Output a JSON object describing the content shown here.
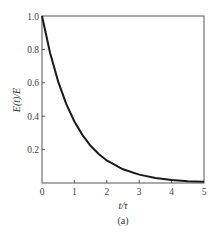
{
  "chart_data": {
    "type": "line",
    "title": "",
    "caption": "(a)",
    "xlabel": "t/τ",
    "ylabel": "E(t)/E",
    "xlim": [
      0,
      5
    ],
    "ylim": [
      0,
      1.0
    ],
    "x_ticks": [
      "0",
      "1",
      "2",
      "3",
      "4",
      "5"
    ],
    "y_ticks": [
      "0.2",
      "0.4",
      "0.6",
      "0.8",
      "1.0"
    ],
    "grid": false,
    "legend": null,
    "series": [
      {
        "name": "E(t)/E = exp(-t/τ)",
        "x": [
          0,
          0.25,
          0.5,
          0.75,
          1.0,
          1.25,
          1.5,
          1.75,
          2.0,
          2.5,
          3.0,
          3.5,
          4.0,
          4.5,
          5.0
        ],
        "values": [
          1.0,
          0.779,
          0.607,
          0.472,
          0.368,
          0.287,
          0.223,
          0.174,
          0.135,
          0.082,
          0.05,
          0.03,
          0.018,
          0.011,
          0.007
        ]
      }
    ]
  }
}
